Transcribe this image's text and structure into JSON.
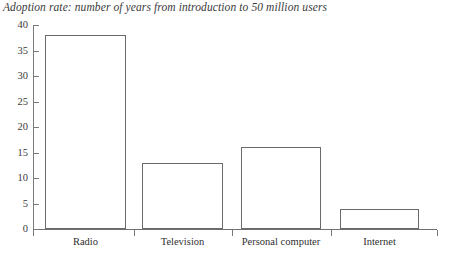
{
  "chart_data": {
    "type": "bar",
    "title": "Adoption rate: number of years from introduction to 50 million users",
    "xlabel": "",
    "ylabel": "",
    "categories": [
      "Radio",
      "Television",
      "Personal computer",
      "Internet"
    ],
    "values": [
      38,
      13,
      16,
      4
    ],
    "ylim": [
      0,
      40
    ],
    "yticks": [
      0,
      5,
      10,
      15,
      20,
      25,
      30,
      35,
      40
    ],
    "ytick_labels": [
      "0",
      "5",
      "10",
      "15",
      "20",
      "25",
      "30",
      "35",
      "40"
    ],
    "grid": false,
    "legend": null,
    "series": [
      {
        "name": "Years to 50 million users",
        "values": [
          38,
          13,
          16,
          4
        ]
      }
    ],
    "colors": {
      "bar_fill": "#ffffff",
      "bar_stroke": "#6a6a6a",
      "axis": "#7a7a7a",
      "text": "#2b2b2b"
    }
  }
}
